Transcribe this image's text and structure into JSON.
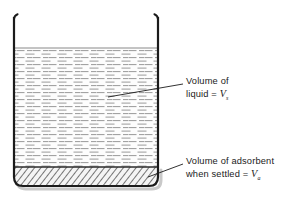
{
  "figure": {
    "background_color": "#ffffff",
    "ink_color": "#1b1b1b"
  },
  "beaker": {
    "name": "beaker",
    "wall_color": "#1b1b1b",
    "wall_width_px": 2.2,
    "left_wall_x": 14,
    "right_wall_x": 158,
    "rim_y": 17,
    "base_y": 186,
    "base_corner_radius": 9,
    "shadow_color": "#c9c9c9"
  },
  "liquid": {
    "name": "liquid-region",
    "surface_y": 48,
    "bottom_y": 167,
    "fill_color": "#fdfdfd",
    "surface_line_color": "#7a7a7a",
    "dash_color": "#9a9a9a",
    "pattern": "horizontal-dashes"
  },
  "adsorbent": {
    "name": "adsorbent-region",
    "top_y": 167,
    "bottom_y": 186,
    "fill_color": "#f2f2f2",
    "hatch_color": "#4a4a4a",
    "pattern": "diagonal-hatch"
  },
  "leaders": {
    "liquid": {
      "name": "leader-line-liquid",
      "from_x": 108,
      "from_y": 97,
      "to_x": 183,
      "to_y": 84,
      "color": "#1b1b1b"
    },
    "adsorbent": {
      "name": "leader-line-adsorbent",
      "from_x": 148,
      "from_y": 177,
      "to_x": 183,
      "to_y": 164,
      "color": "#1b1b1b"
    }
  },
  "labels": {
    "liquid": {
      "line1": "Volume of",
      "line2_prefix": "liquid = ",
      "symbol": "V",
      "subscript": "s"
    },
    "adsorbent": {
      "line1": "Volume of adsorbent",
      "line2_prefix": "when settled = ",
      "symbol": "V",
      "subscript": "a"
    }
  }
}
